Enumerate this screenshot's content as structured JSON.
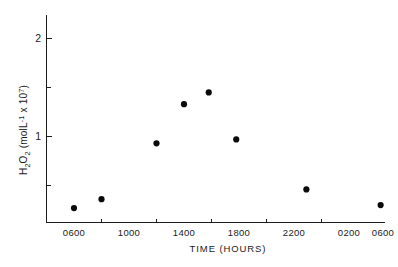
{
  "chart_data": {
    "type": "scatter",
    "title": "",
    "xlabel": "TIME (HOURS)",
    "ylabel": "H2O2 (molL-1 x 107)",
    "ylabel_parts": {
      "h": "H",
      "h_sub": "2",
      "o": "O",
      "o_sub": "2",
      "open": " (molL",
      "sup_minus_one": "-1",
      "mid": " x 10",
      "sup_seven": "7",
      "close": ")"
    },
    "x_tick_labels": [
      "0600",
      "1000",
      "1400",
      "1800",
      "2200",
      "0200",
      "0600"
    ],
    "x_tick_values": [
      600,
      1000,
      1400,
      1800,
      2200,
      2600,
      3000
    ],
    "y_tick_labels": [
      "1",
      "2"
    ],
    "y_tick_values": [
      1,
      2
    ],
    "y_minor_tick_values": [
      0.5,
      1.5
    ],
    "xlim": [
      400,
      3120
    ],
    "ylim": [
      0,
      2.18
    ],
    "grid": false,
    "legend": "none",
    "marker": "filled-circle",
    "marker_color": "#0a0a0a",
    "points": [
      {
        "label": "0600",
        "x": 600,
        "y": 0.27
      },
      {
        "label": "0800",
        "x": 800,
        "y": 0.36
      },
      {
        "label": "1200",
        "x": 1200,
        "y": 0.93
      },
      {
        "label": "1400",
        "x": 1400,
        "y": 1.33
      },
      {
        "label": "1600",
        "x": 1580,
        "y": 1.45
      },
      {
        "label": "1800",
        "x": 1780,
        "y": 0.97
      },
      {
        "label": "2300",
        "x": 2290,
        "y": 0.46
      },
      {
        "label": "0430",
        "x": 2830,
        "y": 0.3
      }
    ],
    "series": [
      {
        "name": "H2O2 concentration",
        "x": [
          600,
          800,
          1200,
          1400,
          1580,
          1780,
          2290,
          2830
        ],
        "values": [
          0.27,
          0.36,
          0.93,
          1.33,
          1.45,
          0.97,
          0.46,
          0.3
        ]
      }
    ]
  },
  "figure": {
    "background": "#ffffff",
    "axis_color": "#1c1c1c"
  }
}
